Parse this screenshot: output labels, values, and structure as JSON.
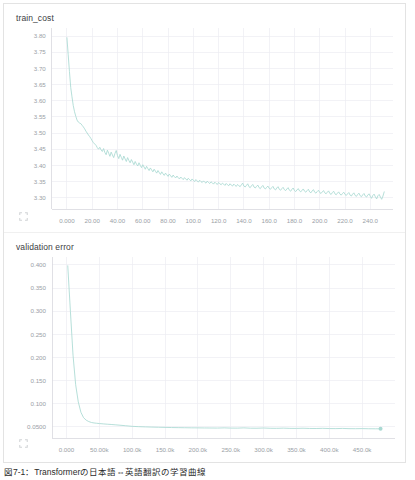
{
  "panel": {
    "background_color": "#ffffff",
    "border_color": "#e3e3e3"
  },
  "caption": {
    "text": "図7-1：Transformerの日本語⇔英語翻訳の学習曲線"
  },
  "icons": {
    "expand_top": "expand-icon",
    "expand_bottom": "expand-icon"
  },
  "chart_data": [
    {
      "id": "train_cost",
      "type": "line",
      "title": "train_cost",
      "xlabel": "",
      "ylabel": "",
      "grid": true,
      "legend": null,
      "line_color": "#a9d9d2",
      "xlim": [
        -12,
        258
      ],
      "ylim": [
        3.265,
        3.825
      ],
      "xticks": [
        0,
        20,
        40,
        60,
        80,
        100,
        120,
        140,
        160,
        180,
        200,
        220,
        240
      ],
      "xtick_labels": [
        "0.000",
        "20.00",
        "40.00",
        "60.00",
        "80.00",
        "100.0",
        "120.0",
        "140.0",
        "160.0",
        "180.0",
        "200.0",
        "220.0",
        "240.0"
      ],
      "yticks": [
        3.8,
        3.75,
        3.7,
        3.65,
        3.6,
        3.55,
        3.5,
        3.45,
        3.4,
        3.35,
        3.3
      ],
      "ytick_labels": [
        "3.80",
        "3.75",
        "3.70",
        "3.65",
        "3.60",
        "3.55",
        "3.50",
        "3.45",
        "3.40",
        "3.35",
        "3.30"
      ],
      "x": [
        0,
        1,
        2,
        3,
        4,
        5,
        6,
        7,
        8,
        9,
        10,
        11,
        12,
        13,
        14,
        15,
        16,
        17,
        18,
        19,
        20,
        21,
        22,
        23,
        24,
        25,
        26,
        27,
        28,
        29,
        30,
        31,
        32,
        33,
        34,
        35,
        36,
        37,
        38,
        39,
        40,
        41,
        42,
        43,
        44,
        45,
        46,
        47,
        48,
        49,
        50,
        51,
        52,
        53,
        54,
        55,
        56,
        57,
        58,
        59,
        60,
        61,
        62,
        63,
        64,
        65,
        66,
        67,
        68,
        69,
        70,
        71,
        72,
        73,
        74,
        75,
        76,
        77,
        78,
        79,
        80,
        81,
        82,
        83,
        84,
        85,
        86,
        87,
        88,
        89,
        90,
        91,
        92,
        93,
        94,
        95,
        96,
        97,
        98,
        99,
        100,
        101,
        102,
        103,
        104,
        105,
        106,
        107,
        108,
        109,
        110,
        111,
        112,
        113,
        114,
        115,
        116,
        117,
        118,
        119,
        120,
        121,
        122,
        123,
        124,
        125,
        126,
        127,
        128,
        129,
        130,
        131,
        132,
        133,
        134,
        135,
        136,
        137,
        138,
        139,
        140,
        141,
        142,
        143,
        144,
        145,
        146,
        147,
        148,
        149,
        150,
        151,
        152,
        153,
        154,
        155,
        156,
        157,
        158,
        159,
        160,
        161,
        162,
        163,
        164,
        165,
        166,
        167,
        168,
        169,
        170,
        171,
        172,
        173,
        174,
        175,
        176,
        177,
        178,
        179,
        180,
        181,
        182,
        183,
        184,
        185,
        186,
        187,
        188,
        189,
        190,
        191,
        192,
        193,
        194,
        195,
        196,
        197,
        198,
        199,
        200,
        201,
        202,
        203,
        204,
        205,
        206,
        207,
        208,
        209,
        210,
        211,
        212,
        213,
        214,
        215,
        216,
        217,
        218,
        219,
        220,
        221,
        222,
        223,
        224,
        225,
        226,
        227,
        228,
        229,
        230,
        231,
        232,
        233,
        234,
        235,
        236,
        237,
        238,
        239,
        240,
        241,
        242,
        243,
        244,
        245,
        246,
        247,
        248,
        249,
        250,
        251
      ],
      "values": [
        3.795,
        3.742,
        3.69,
        3.641,
        3.612,
        3.585,
        3.566,
        3.552,
        3.54,
        3.534,
        3.531,
        3.529,
        3.524,
        3.519,
        3.513,
        3.506,
        3.5,
        3.494,
        3.489,
        3.483,
        3.476,
        3.47,
        3.466,
        3.462,
        3.455,
        3.45,
        3.456,
        3.448,
        3.443,
        3.452,
        3.44,
        3.433,
        3.447,
        3.438,
        3.428,
        3.441,
        3.432,
        3.424,
        3.437,
        3.446,
        3.43,
        3.421,
        3.434,
        3.425,
        3.416,
        3.429,
        3.42,
        3.412,
        3.424,
        3.415,
        3.408,
        3.418,
        3.41,
        3.402,
        3.412,
        3.404,
        3.398,
        3.408,
        3.4,
        3.393,
        3.402,
        3.395,
        3.388,
        3.397,
        3.39,
        3.384,
        3.392,
        3.386,
        3.38,
        3.388,
        3.382,
        3.376,
        3.384,
        3.378,
        3.372,
        3.38,
        3.374,
        3.369,
        3.376,
        3.371,
        3.366,
        3.373,
        3.368,
        3.363,
        3.37,
        3.365,
        3.361,
        3.367,
        3.362,
        3.358,
        3.364,
        3.36,
        3.356,
        3.362,
        3.358,
        3.354,
        3.36,
        3.356,
        3.352,
        3.358,
        3.354,
        3.35,
        3.356,
        3.352,
        3.348,
        3.354,
        3.35,
        3.347,
        3.352,
        3.348,
        3.345,
        3.351,
        3.347,
        3.344,
        3.349,
        3.346,
        3.342,
        3.348,
        3.344,
        3.341,
        3.347,
        3.343,
        3.34,
        3.345,
        3.342,
        3.338,
        3.344,
        3.34,
        3.337,
        3.343,
        3.339,
        3.336,
        3.342,
        3.338,
        3.335,
        3.341,
        3.337,
        3.334,
        3.34,
        3.345,
        3.336,
        3.333,
        3.338,
        3.343,
        3.334,
        3.331,
        3.337,
        3.341,
        3.333,
        3.33,
        3.335,
        3.339,
        3.331,
        3.328,
        3.334,
        3.338,
        3.33,
        3.327,
        3.332,
        3.336,
        3.329,
        3.326,
        3.331,
        3.335,
        3.327,
        3.324,
        3.33,
        3.334,
        3.326,
        3.323,
        3.328,
        3.332,
        3.325,
        3.322,
        3.327,
        3.331,
        3.323,
        3.32,
        3.326,
        3.33,
        3.322,
        3.319,
        3.324,
        3.328,
        3.321,
        3.318,
        3.323,
        3.327,
        3.32,
        3.317,
        3.322,
        3.326,
        3.318,
        3.315,
        3.321,
        3.325,
        3.317,
        3.314,
        3.319,
        3.323,
        3.316,
        3.313,
        3.318,
        3.322,
        3.315,
        3.312,
        3.317,
        3.321,
        3.313,
        3.31,
        3.316,
        3.32,
        3.312,
        3.309,
        3.314,
        3.318,
        3.311,
        3.308,
        3.313,
        3.317,
        3.31,
        3.307,
        3.312,
        3.316,
        3.308,
        3.305,
        3.311,
        3.315,
        3.307,
        3.304,
        3.31,
        3.314,
        3.306,
        3.303,
        3.309,
        3.313,
        3.305,
        3.302,
        3.308,
        3.312,
        3.304,
        3.298,
        3.307,
        3.311,
        3.303,
        3.296,
        3.306,
        3.31,
        3.302,
        3.295,
        3.305,
        3.318,
        3.3,
        3.293,
        3.304,
        3.299
      ]
    },
    {
      "id": "validation_error",
      "type": "line",
      "title": "validation error",
      "xlabel": "",
      "ylabel": "",
      "grid": true,
      "legend": null,
      "line_color": "#a9d9d2",
      "xlim": [
        -22000,
        500000
      ],
      "ylim": [
        0.026,
        0.417
      ],
      "xticks": [
        0,
        50000,
        100000,
        150000,
        200000,
        250000,
        300000,
        350000,
        400000,
        450000
      ],
      "xtick_labels": [
        "0.000",
        "50.00k",
        "100.0k",
        "150.0k",
        "200.0k",
        "250.0k",
        "300.0k",
        "350.0k",
        "400.0k",
        "450.0k"
      ],
      "yticks": [
        0.4,
        0.35,
        0.3,
        0.25,
        0.2,
        0.15,
        0.1,
        0.05
      ],
      "ytick_labels": [
        "0.400",
        "0.350",
        "0.300",
        "0.250",
        "0.200",
        "0.150",
        "0.100",
        "0.0500"
      ],
      "x": [
        2000,
        6000,
        10000,
        14000,
        18000,
        22000,
        26000,
        30000,
        34000,
        38000,
        42000,
        46000,
        50000,
        56000,
        62000,
        68000,
        74000,
        80000,
        90000,
        100000,
        110000,
        120000,
        130000,
        140000,
        150000,
        160000,
        170000,
        180000,
        190000,
        200000,
        210000,
        220000,
        230000,
        240000,
        250000,
        260000,
        270000,
        280000,
        290000,
        300000,
        310000,
        320000,
        330000,
        340000,
        350000,
        360000,
        370000,
        380000,
        390000,
        400000,
        410000,
        420000,
        430000,
        440000,
        450000,
        460000,
        470000,
        478000
      ],
      "values": [
        0.398,
        0.3,
        0.205,
        0.141,
        0.104,
        0.0815,
        0.07,
        0.0645,
        0.0615,
        0.0595,
        0.0585,
        0.0578,
        0.0572,
        0.0565,
        0.0558,
        0.0552,
        0.0545,
        0.0538,
        0.0525,
        0.0512,
        0.0505,
        0.05,
        0.0496,
        0.0492,
        0.0489,
        0.0486,
        0.0484,
        0.0482,
        0.048,
        0.0479,
        0.0477,
        0.0476,
        0.0475,
        0.0479,
        0.0474,
        0.0473,
        0.0479,
        0.0472,
        0.0471,
        0.0476,
        0.047,
        0.0469,
        0.0473,
        0.0468,
        0.0467,
        0.0471,
        0.0466,
        0.0465,
        0.0469,
        0.0464,
        0.0463,
        0.0467,
        0.0462,
        0.0461,
        0.0463,
        0.046,
        0.0459,
        0.0458
      ],
      "end_marker": {
        "x": 478000,
        "y": 0.0458,
        "color": "#a9d9d2",
        "radius": 2.0
      }
    }
  ]
}
